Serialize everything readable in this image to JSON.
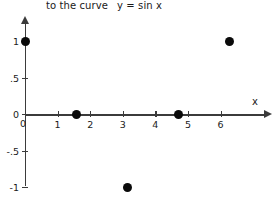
{
  "title": {
    "prefix": "to the curve",
    "equation": "y = sin x"
  },
  "axis_labels": {
    "x_name": "x"
  },
  "origin_label": "0",
  "chart_data": {
    "type": "scatter",
    "xlabel": "x",
    "ylabel": "",
    "xlim": [
      0,
      6.6
    ],
    "ylim": [
      -1,
      1
    ],
    "grid": false,
    "legend": null,
    "x_ticks": [
      {
        "value": 0,
        "label": "0"
      },
      {
        "value": 1,
        "label": "1"
      },
      {
        "value": 2,
        "label": "2"
      },
      {
        "value": 3,
        "label": "3"
      },
      {
        "value": 4,
        "label": "4"
      },
      {
        "value": 5,
        "label": "5"
      },
      {
        "value": 6,
        "label": "6"
      }
    ],
    "y_ticks": [
      {
        "value": 1,
        "label": "1"
      },
      {
        "value": 0.5,
        "label": ".5"
      },
      {
        "value": 0,
        "label": "0"
      },
      {
        "value": -0.5,
        "label": "-.5"
      },
      {
        "value": -1,
        "label": "-1"
      }
    ],
    "series": [
      {
        "name": "y = sin x sample points",
        "marker": "filled-circle",
        "color": "#0a0a0a",
        "points": [
          {
            "x": 0,
            "y": 1
          },
          {
            "x": 1.57,
            "y": 0
          },
          {
            "x": 3.14,
            "y": -1
          },
          {
            "x": 4.71,
            "y": 0
          },
          {
            "x": 6.28,
            "y": 1
          }
        ]
      }
    ]
  }
}
